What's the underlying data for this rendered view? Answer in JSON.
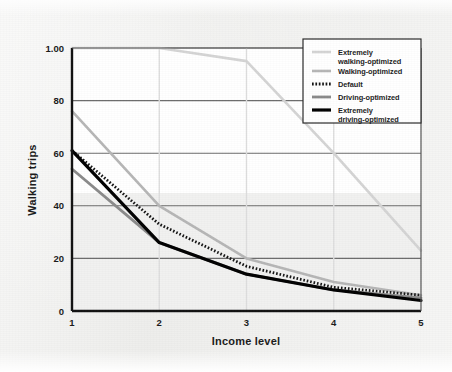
{
  "figure": {
    "background_color": "#eeeeec",
    "plot_background_color": "#ffffff",
    "axis_color": "#111111",
    "grid_color": "#6b6b6b"
  },
  "chart_data": {
    "type": "line",
    "title": "",
    "xlabel": "Income level",
    "ylabel": "Walking trips",
    "x": [
      1,
      2,
      3,
      4,
      5
    ],
    "xlim": [
      1,
      5
    ],
    "ylim": [
      0,
      100
    ],
    "xticks": [
      "1",
      "2",
      "3",
      "4",
      "5"
    ],
    "yticks": [
      "0",
      "20",
      "40",
      "60",
      "80",
      "1.00"
    ],
    "ytick_values": [
      0,
      20,
      40,
      60,
      80,
      100
    ],
    "grid": true,
    "grid_axis": "y",
    "legend_position": "top-right",
    "series": [
      {
        "name": "Extremely walking-optimized",
        "color": "#d4d4d4",
        "style": "solid",
        "width": 2.6,
        "values": [
          100,
          100,
          95,
          60,
          23
        ]
      },
      {
        "name": "Walking-optimized",
        "color": "#b6b6b6",
        "style": "solid",
        "width": 2.6,
        "values": [
          76,
          40,
          20,
          11,
          6
        ]
      },
      {
        "name": "Default",
        "color": "#141414",
        "style": "dotted",
        "width": 2.8,
        "values": [
          61,
          33,
          17,
          9,
          6
        ]
      },
      {
        "name": "Driving-optimized",
        "color": "#8a8a8a",
        "style": "solid",
        "width": 2.8,
        "values": [
          54,
          26,
          14,
          8,
          5
        ]
      },
      {
        "name": "Extremely driving-optimized",
        "color": "#000000",
        "style": "solid",
        "width": 3.2,
        "values": [
          61,
          26,
          14,
          8,
          4
        ]
      }
    ]
  },
  "legend": {
    "items": [
      {
        "label_line1": "Extremely",
        "label_line2": "walking-optimized"
      },
      {
        "label_line1": "Walking-optimized",
        "label_line2": ""
      },
      {
        "label_line1": "Default",
        "label_line2": ""
      },
      {
        "label_line1": "Driving-optimized",
        "label_line2": ""
      },
      {
        "label_line1": "Extremely",
        "label_line2": "driving-optimized"
      }
    ]
  }
}
